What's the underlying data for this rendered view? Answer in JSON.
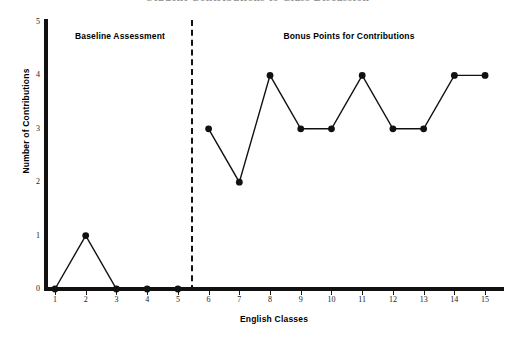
{
  "chart_data": {
    "type": "line",
    "title": "Student Contributions to Class Discussion",
    "xlabel": "English Classes",
    "ylabel": "Number of Contributions",
    "x": [
      1,
      2,
      3,
      4,
      5,
      6,
      7,
      8,
      9,
      10,
      11,
      12,
      13,
      14,
      15
    ],
    "xticklabels": [
      "1",
      "2",
      "3",
      "4",
      "5",
      "6",
      "7",
      "8",
      "9",
      "10",
      "11",
      "12",
      "13",
      "14",
      "15"
    ],
    "yticklabels": [
      "0",
      "1",
      "2",
      "3",
      "4",
      "5"
    ],
    "yticks": [
      0,
      1,
      2,
      3,
      4,
      5
    ],
    "ylim": [
      0,
      5
    ],
    "xlim": [
      0.5,
      15.5
    ],
    "grid": false,
    "legend": null,
    "series": [
      {
        "name": "Baseline Assessment",
        "x": [
          1,
          2,
          3,
          4,
          5
        ],
        "values": [
          0,
          1,
          0,
          0,
          0
        ]
      },
      {
        "name": "Bonus Points for Contributions",
        "x": [
          6,
          7,
          8,
          9,
          10,
          11,
          12,
          13,
          14,
          15
        ],
        "values": [
          3,
          2,
          4,
          3,
          3,
          4,
          3,
          3,
          4,
          4
        ]
      }
    ],
    "annotations": [
      {
        "text": "Baseline Assessment",
        "phase": "A",
        "x_range": [
          1,
          5
        ]
      },
      {
        "text": "Bonus Points for Contributions",
        "phase": "B",
        "x_range": [
          6,
          15
        ]
      }
    ],
    "phase_divider_x": 5.5,
    "marker": "filled-circle",
    "line_color": "#111111"
  },
  "colors": {
    "line": "#111111",
    "marker": "#111111",
    "axis": "#111111",
    "text": "#000000",
    "title": "#3a3a3a",
    "background": "#ffffff"
  }
}
